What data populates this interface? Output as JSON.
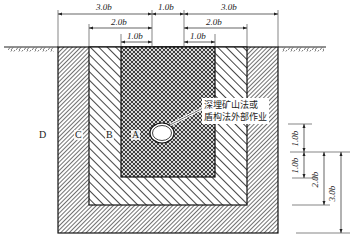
{
  "diagram": {
    "type": "cross-section zoning diagram",
    "top_dimensions": {
      "row1": [
        {
          "label": "3.0b",
          "from_x": 58,
          "to_x": 152
        },
        {
          "label": "1.0b",
          "from_x": 152,
          "to_x": 184
        },
        {
          "label": "3.0b",
          "from_x": 184,
          "to_x": 278
        }
      ],
      "row2": [
        {
          "label": "2.0b",
          "from_x": 89,
          "to_x": 152
        },
        {
          "label": "2.0b",
          "from_x": 184,
          "to_x": 247
        }
      ],
      "row3": [
        {
          "label": "1.0b",
          "from_x": 121,
          "to_x": 152
        },
        {
          "label": "1.0b",
          "from_x": 184,
          "to_x": 215
        }
      ]
    },
    "zones": [
      {
        "id": "A",
        "label": "A",
        "pattern": "crosshatch"
      },
      {
        "id": "B",
        "label": "B",
        "pattern": "wide-diagonal"
      },
      {
        "id": "C",
        "label": "C",
        "pattern": "dense-diagonal"
      },
      {
        "id": "D",
        "label": "D",
        "pattern": "none"
      }
    ],
    "note": {
      "line1": "深埋矿山法或",
      "line2": "盾构法外部作业"
    },
    "side_dimensions": [
      {
        "label": "1.0b"
      },
      {
        "label": "1.0b"
      },
      {
        "label": "2.0b"
      },
      {
        "label": "3.0b"
      }
    ]
  }
}
